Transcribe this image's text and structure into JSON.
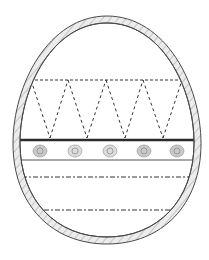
{
  "image": {
    "title": "Easter egg coloring outline",
    "description": "Egg outline with zig-zag dashed band, dotted circle band and two dashed lines",
    "colors": {
      "background": "#ffffff",
      "outline": "#4a4a4a",
      "border_fill": "#e6e6e6",
      "border_hatch": "#b8b8b8",
      "dash": "#333333",
      "band_dots": "#b9b9b9",
      "band_dots_dark": "#8f8f8f"
    },
    "egg": {
      "cx": 107,
      "top": 16,
      "bottom": 244,
      "half_width": 94,
      "border_width": 7
    },
    "zigzag": {
      "top_y": 80,
      "bottom_y": 138,
      "top_points_x": [
        31,
        68,
        106,
        143,
        182
      ],
      "bottom_points_x": [
        50,
        87,
        125,
        163
      ]
    },
    "band": {
      "top_y": 140,
      "bottom_y": 160,
      "dots_x": [
        40,
        75,
        110,
        144,
        177
      ],
      "dot_y": 151
    },
    "dashed_lines_y": [
      177,
      210
    ]
  }
}
